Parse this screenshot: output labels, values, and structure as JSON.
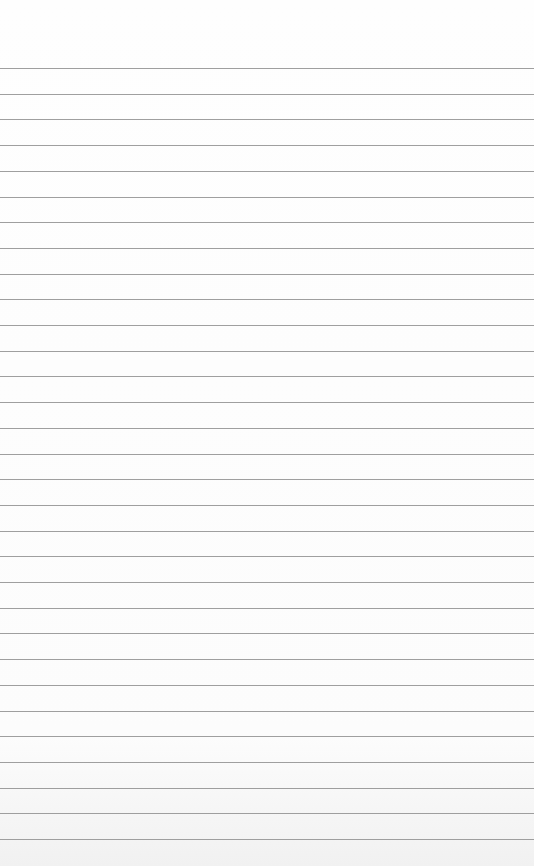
{
  "paper": {
    "type": "lined-paper",
    "line_count": 31,
    "first_line_y": 68,
    "line_spacing": 25.7,
    "line_color": "#8e8e8e",
    "background_color": "#fdfdfd"
  }
}
